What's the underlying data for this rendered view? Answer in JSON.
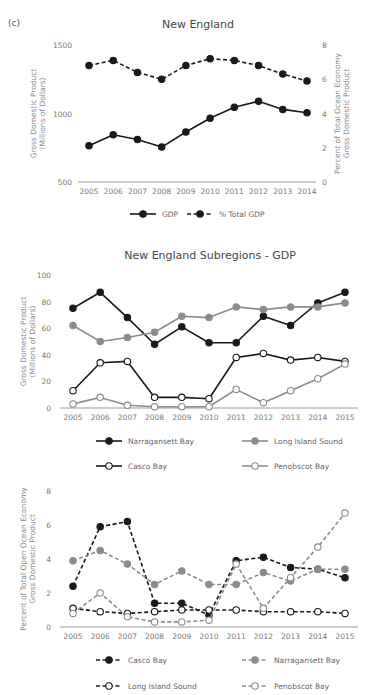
{
  "panel_label": "(c)",
  "chart_data": [
    {
      "id": "new-england",
      "type": "line",
      "title": "New England",
      "xlabel": "",
      "ylabel": "Gross Domestic Product (Millions of Dollars)",
      "ylabel_lines": [
        "Gross Domestic Product",
        "(Millions of Dollars)"
      ],
      "y2label": "Percent of Total Ocean Economy Gross Domestic Product",
      "y2label_lines": [
        "Percent of Total Ocean Economy",
        "Gross Domestic Product"
      ],
      "x": [
        2005,
        2006,
        2007,
        2008,
        2009,
        2010,
        2011,
        2012,
        2013,
        2014
      ],
      "ylim": [
        500,
        1500
      ],
      "yticks": [
        500,
        1000,
        1500
      ],
      "y2lim": [
        0,
        8
      ],
      "y2ticks": [
        0,
        2,
        4,
        6,
        8
      ],
      "grid": false,
      "legend_position": "bottom",
      "series": [
        {
          "name": "GDP",
          "axis": "left",
          "style": "solid",
          "marker": "filled",
          "color": "#1a1a1a",
          "values": [
            765,
            845,
            810,
            755,
            865,
            965,
            1045,
            1090,
            1030,
            1005
          ]
        },
        {
          "name": "% Total GDP",
          "axis": "right",
          "style": "dashed",
          "marker": "filled",
          "color": "#1a1a1a",
          "values": [
            6.8,
            7.1,
            6.4,
            6.0,
            6.8,
            7.2,
            7.1,
            6.8,
            6.3,
            5.9
          ]
        }
      ]
    },
    {
      "id": "subregions-gdp",
      "type": "line",
      "title": "New England Subregions - GDP",
      "xlabel": "",
      "ylabel": "Gross Domestic Product (Millions of Dollars)",
      "ylabel_lines": [
        "Gross Domestic Product",
        "(Millions of Dollars)"
      ],
      "x": [
        2005,
        2006,
        2007,
        2008,
        2009,
        2010,
        2011,
        2012,
        2013,
        2014,
        2015
      ],
      "ylim": [
        0,
        100
      ],
      "yticks": [
        0,
        20,
        40,
        60,
        80,
        100
      ],
      "grid": false,
      "legend_position": "bottom",
      "series": [
        {
          "name": "Narragansett Bay",
          "style": "solid",
          "marker": "filled",
          "color": "#1a1a1a",
          "values": [
            75,
            87,
            68,
            48,
            61,
            49,
            49,
            69,
            62,
            79,
            87
          ]
        },
        {
          "name": "Long Island Sound",
          "style": "solid",
          "marker": "filled",
          "color": "#8c8c8c",
          "values": [
            62,
            50,
            53,
            57,
            69,
            68,
            76,
            74,
            76,
            76,
            79
          ]
        },
        {
          "name": "Casco Bay",
          "style": "solid",
          "marker": "open",
          "color": "#1a1a1a",
          "values": [
            13,
            34,
            35,
            8,
            8,
            7,
            38,
            41,
            36,
            38,
            35
          ]
        },
        {
          "name": "Penobscot Bay",
          "style": "solid",
          "marker": "open",
          "color": "#8c8c8c",
          "values": [
            3,
            8,
            2,
            1,
            1,
            1,
            14,
            4,
            13,
            22,
            33
          ]
        }
      ]
    },
    {
      "id": "subregions-percent",
      "type": "line",
      "title": "",
      "xlabel": "",
      "ylabel": "Percent of Total Open Ocean Economy Gross Domestic Product",
      "ylabel_lines": [
        "Percent of Total Open Ocean Economy",
        "Gross Domestic Product"
      ],
      "x": [
        2005,
        2006,
        2007,
        2008,
        2009,
        2010,
        2011,
        2012,
        2013,
        2014,
        2015
      ],
      "ylim": [
        0,
        8
      ],
      "yticks": [
        0,
        2,
        4,
        6,
        8
      ],
      "grid": false,
      "legend_position": "bottom",
      "series": [
        {
          "name": "Casco Bay",
          "style": "dashed",
          "marker": "filled",
          "color": "#1a1a1a",
          "values": [
            2.4,
            5.9,
            6.2,
            1.4,
            1.4,
            0.7,
            3.9,
            4.1,
            3.5,
            3.4,
            2.9
          ]
        },
        {
          "name": "Narragansett Bay",
          "style": "dashed",
          "marker": "filled",
          "color": "#8c8c8c",
          "values": [
            3.9,
            4.5,
            3.7,
            2.5,
            3.3,
            2.5,
            2.5,
            3.2,
            2.7,
            3.4,
            3.4
          ]
        },
        {
          "name": "Long Island Sound",
          "style": "dashed",
          "marker": "open",
          "color": "#1a1a1a",
          "values": [
            1.1,
            0.9,
            0.8,
            0.9,
            1.0,
            1.0,
            1.0,
            0.9,
            0.9,
            0.9,
            0.8
          ]
        },
        {
          "name": "Penobscot Bay",
          "style": "dashed",
          "marker": "open",
          "color": "#8c8c8c",
          "values": [
            0.8,
            2.0,
            0.6,
            0.3,
            0.3,
            0.4,
            3.7,
            1.1,
            2.9,
            4.7,
            6.7
          ]
        }
      ]
    }
  ]
}
